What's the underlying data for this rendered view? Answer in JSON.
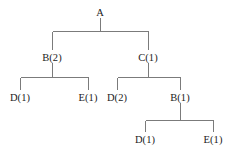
{
  "diagram": {
    "type": "tree",
    "title": "",
    "line_color": "#7b7b7b",
    "text_color": "#1b1b1b",
    "background_color": "#ffffff",
    "nodes": [
      {
        "id": "n0",
        "label": "A",
        "x": 100,
        "y": 12,
        "level": 0
      },
      {
        "id": "n1",
        "label": "B(2)",
        "x": 52,
        "y": 57,
        "level": 1
      },
      {
        "id": "n2",
        "label": "C(1)",
        "x": 148,
        "y": 57,
        "level": 1
      },
      {
        "id": "n3",
        "label": "D(1)",
        "x": 20,
        "y": 97,
        "level": 2
      },
      {
        "id": "n4",
        "label": "E(1)",
        "x": 88,
        "y": 97,
        "level": 2
      },
      {
        "id": "n5",
        "label": "D(2)",
        "x": 117,
        "y": 97,
        "level": 2
      },
      {
        "id": "n6",
        "label": "B(1)",
        "x": 180,
        "y": 97,
        "level": 2
      },
      {
        "id": "n7",
        "label": "D(1)",
        "x": 145,
        "y": 139,
        "level": 3
      },
      {
        "id": "n8",
        "label": "E(1)",
        "x": 213,
        "y": 139,
        "level": 3
      }
    ],
    "edges": [
      {
        "from": "n0",
        "to": "n1"
      },
      {
        "from": "n0",
        "to": "n2"
      },
      {
        "from": "n1",
        "to": "n3"
      },
      {
        "from": "n1",
        "to": "n4"
      },
      {
        "from": "n2",
        "to": "n5"
      },
      {
        "from": "n2",
        "to": "n6"
      },
      {
        "from": "n6",
        "to": "n7"
      },
      {
        "from": "n6",
        "to": "n8"
      }
    ],
    "connectors": [
      {
        "name": "connector-a",
        "parent_x": 100,
        "stem_top": 18,
        "bar_y": 31,
        "left_x": 52,
        "right_x": 148,
        "child_top": 50
      },
      {
        "name": "connector-b2",
        "parent_x": 52,
        "stem_top": 63,
        "bar_y": 77,
        "left_x": 20,
        "right_x": 88,
        "child_top": 90
      },
      {
        "name": "connector-c1",
        "parent_x": 148,
        "stem_top": 63,
        "bar_y": 77,
        "left_x": 117,
        "right_x": 180,
        "child_top": 90
      },
      {
        "name": "connector-b1",
        "parent_x": 180,
        "stem_top": 103,
        "bar_y": 120,
        "left_x": 145,
        "right_x": 213,
        "child_top": 132
      }
    ]
  }
}
